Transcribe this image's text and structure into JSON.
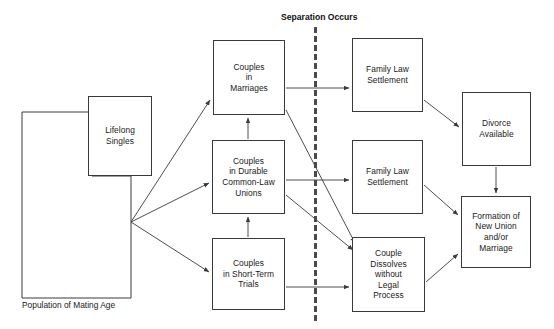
{
  "diagram": {
    "title": "Separation Occurs",
    "caption": "Population of Mating Age",
    "separator": {
      "label": "Separation Occurs",
      "style": "dashed-vertical",
      "color": "#4a4a4a"
    },
    "stroke_color": "#3a3a3a",
    "background_color": "#ffffff",
    "text_color": "#1a1a1a",
    "nodes": [
      {
        "id": "population",
        "label": "Population of Mating Age",
        "shape": "notched-rect",
        "x": 22,
        "y": 112,
        "w": 109,
        "h": 184
      },
      {
        "id": "lifelong",
        "label": "Lifelong\nSingles",
        "shape": "rect",
        "x": 88,
        "y": 96,
        "w": 64,
        "h": 80
      },
      {
        "id": "marriages",
        "label": "Couples\nin\nMarriages",
        "shape": "rect",
        "x": 213,
        "y": 40,
        "w": 72,
        "h": 75
      },
      {
        "id": "commonlaw",
        "label": "Couples\nin Durable\nCommon-Law\nUnions",
        "shape": "rect",
        "x": 212,
        "y": 140,
        "w": 73,
        "h": 74
      },
      {
        "id": "shortterm",
        "label": "Couples\nin Short-Term\nTrials",
        "shape": "rect",
        "x": 212,
        "y": 238,
        "w": 73,
        "h": 72
      },
      {
        "id": "settlement_top",
        "label": "Family Law\nSettlement",
        "shape": "rect",
        "x": 352,
        "y": 38,
        "w": 71,
        "h": 74
      },
      {
        "id": "settlement_mid",
        "label": "Family Law\nSettlement",
        "shape": "rect",
        "x": 352,
        "y": 140,
        "w": 71,
        "h": 74
      },
      {
        "id": "dissolves",
        "label": "Couple\nDissolves\nwithout\nLegal\nProcess",
        "shape": "rect",
        "x": 352,
        "y": 237,
        "w": 73,
        "h": 75
      },
      {
        "id": "divorce",
        "label": "Divorce\nAvailable",
        "shape": "rect",
        "x": 462,
        "y": 92,
        "w": 69,
        "h": 74
      },
      {
        "id": "formation",
        "label": "Formation of\nNew Union\nand/or\nMarriage",
        "shape": "rect",
        "x": 461,
        "y": 196,
        "w": 70,
        "h": 72
      }
    ],
    "edges": [
      {
        "from": "population",
        "to": "marriages",
        "kind": "fan"
      },
      {
        "from": "population",
        "to": "commonlaw",
        "kind": "fan"
      },
      {
        "from": "population",
        "to": "shortterm",
        "kind": "fan"
      },
      {
        "from": "commonlaw",
        "to": "marriages",
        "kind": "vertical-up"
      },
      {
        "from": "shortterm",
        "to": "commonlaw",
        "kind": "vertical-up"
      },
      {
        "from": "marriages",
        "to": "settlement_top",
        "kind": "horizontal"
      },
      {
        "from": "commonlaw",
        "to": "settlement_mid",
        "kind": "horizontal"
      },
      {
        "from": "shortterm",
        "to": "dissolves",
        "kind": "horizontal"
      },
      {
        "from": "marriages",
        "to": "dissolves",
        "kind": "diagonal"
      },
      {
        "from": "commonlaw",
        "to": "dissolves",
        "kind": "diagonal"
      },
      {
        "from": "settlement_top",
        "to": "divorce",
        "kind": "diagonal"
      },
      {
        "from": "settlement_mid",
        "to": "formation",
        "kind": "diagonal"
      },
      {
        "from": "divorce",
        "to": "formation",
        "kind": "vertical-down"
      },
      {
        "from": "dissolves",
        "to": "formation",
        "kind": "diagonal"
      }
    ]
  }
}
